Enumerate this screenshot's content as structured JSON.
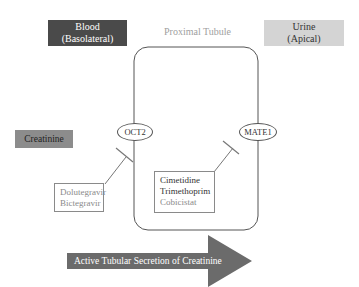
{
  "compartments": {
    "blood": {
      "line1": "Blood",
      "line2": "(Basolateral)",
      "color": "#4a4a4a"
    },
    "urine": {
      "line1": "Urine",
      "line2": "(Apical)",
      "color": "#d4d4d4"
    },
    "tubule": {
      "label": "Proximal Tubule"
    }
  },
  "substrate": {
    "label": "Creatinine",
    "color": "#8c8c8c"
  },
  "transporters": {
    "oct2": {
      "label": "OCT2"
    },
    "mate1": {
      "label": "MATE1"
    }
  },
  "inhibitors": {
    "oct2": {
      "drugs": [
        "Dolutegravir",
        "Bictegravir"
      ]
    },
    "mate1": {
      "drugs": [
        "Cimetidine",
        "Trimethoprim",
        "Cobicistat"
      ]
    }
  },
  "flow_arrow": {
    "label": "Active Tubular Secretion of Creatinine",
    "color": "#6b6b6b"
  }
}
